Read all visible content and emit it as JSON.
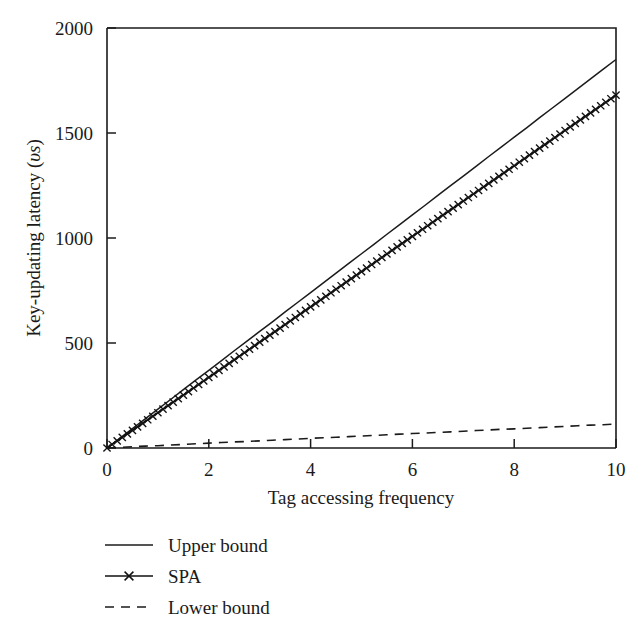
{
  "chart_data": {
    "type": "line",
    "title": "",
    "xlabel": "Tag accessing frequency",
    "ylabel": "Key-updating latency (υs)",
    "ylabel_main": "Key-updating latency (",
    "ylabel_unit": "υs",
    "ylabel_close": ")",
    "xlim": [
      0,
      10
    ],
    "ylim": [
      0,
      2000
    ],
    "xticks": [
      0,
      2,
      4,
      6,
      8,
      10
    ],
    "xticklabels": [
      "0",
      "2",
      "4",
      "6",
      "8",
      "10"
    ],
    "yticks": [
      0,
      500,
      1000,
      1500,
      2000
    ],
    "yticklabels": [
      "0",
      "500",
      "1000",
      "1500",
      "2000"
    ],
    "grid": false,
    "legend_position": "below-left",
    "x": [
      0,
      0.25,
      0.5,
      0.75,
      1,
      1.25,
      1.5,
      1.75,
      2,
      2.25,
      2.5,
      2.75,
      3,
      3.25,
      3.5,
      3.75,
      4,
      4.25,
      4.5,
      4.75,
      5,
      5.25,
      5.5,
      5.75,
      6,
      6.25,
      6.5,
      6.75,
      7,
      7.25,
      7.5,
      7.75,
      8,
      8.25,
      8.5,
      8.75,
      9,
      9.25,
      9.5,
      9.75,
      10
    ],
    "series": [
      {
        "name": "Upper bound",
        "style": "solid",
        "marker": "none",
        "color": "#1b1b1b",
        "values": [
          0,
          46,
          93,
          139,
          185,
          231,
          278,
          324,
          370,
          416,
          463,
          509,
          555,
          601,
          648,
          694,
          740,
          786,
          833,
          879,
          925,
          971,
          1018,
          1064,
          1110,
          1156,
          1203,
          1249,
          1295,
          1341,
          1388,
          1434,
          1480,
          1526,
          1573,
          1619,
          1665,
          1711,
          1758,
          1804,
          1850
        ]
      },
      {
        "name": "SPA",
        "style": "solid",
        "marker": "x",
        "color": "#111111",
        "values": [
          0,
          42,
          84,
          126,
          168,
          210,
          252,
          294,
          336,
          378,
          420,
          462,
          504,
          546,
          588,
          630,
          672,
          714,
          756,
          798,
          840,
          882,
          924,
          966,
          1008,
          1050,
          1092,
          1134,
          1176,
          1218,
          1260,
          1302,
          1344,
          1386,
          1428,
          1470,
          1512,
          1554,
          1596,
          1638,
          1680
        ]
      },
      {
        "name": "Lower bound",
        "style": "dashed",
        "marker": "none",
        "color": "#1b1b1b",
        "values": [
          0,
          3,
          6,
          9,
          11,
          14,
          17,
          20,
          23,
          26,
          29,
          31,
          34,
          37,
          40,
          43,
          46,
          49,
          51,
          54,
          57,
          60,
          63,
          66,
          69,
          71,
          74,
          77,
          80,
          83,
          86,
          89,
          91,
          94,
          97,
          100,
          103,
          106,
          109,
          111,
          114
        ]
      }
    ]
  },
  "legend": {
    "items": [
      {
        "label": "Upper bound",
        "swatch": "solid-line"
      },
      {
        "label": "SPA",
        "swatch": "line-with-x-marker"
      },
      {
        "label": "Lower bound",
        "swatch": "dashed-line"
      }
    ]
  }
}
